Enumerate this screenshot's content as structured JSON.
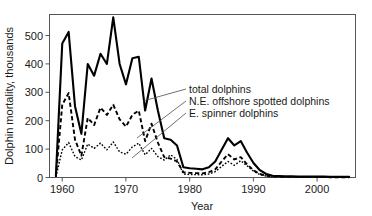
{
  "chart_data": {
    "type": "line",
    "title": "",
    "xlabel": "Year",
    "ylabel": "Dolphin mortality, thousands",
    "xlim": [
      1958,
      2006
    ],
    "ylim": [
      0,
      560
    ],
    "grid": false,
    "legend_position": "inline-annotations",
    "xticks": [
      "1960",
      "1970",
      "1980",
      "1990",
      "2000"
    ],
    "xtick_values": [
      1960,
      1970,
      1980,
      1990,
      2000
    ],
    "yticks": [
      "0",
      "100",
      "200",
      "300",
      "400",
      "500"
    ],
    "ytick_values": [
      0,
      100,
      200,
      300,
      400,
      500
    ],
    "x": [
      1959,
      1960,
      1961,
      1962,
      1963,
      1964,
      1965,
      1966,
      1967,
      1968,
      1969,
      1970,
      1971,
      1972,
      1973,
      1974,
      1975,
      1976,
      1977,
      1978,
      1979,
      1980,
      1981,
      1982,
      1983,
      1984,
      1985,
      1986,
      1987,
      1988,
      1989,
      1990,
      1991,
      1992,
      1993,
      1994,
      1995,
      1996,
      1997,
      1998,
      1999,
      2000,
      2001,
      2002,
      2003,
      2004,
      2005
    ],
    "series": [
      {
        "name": "total dolphins",
        "style": "solid",
        "values": [
          5,
          460,
          500,
          245,
          150,
          390,
          350,
          425,
          390,
          550,
          390,
          320,
          410,
          415,
          230,
          340,
          230,
          135,
          130,
          110,
          35,
          32,
          30,
          28,
          35,
          55,
          95,
          135,
          110,
          125,
          85,
          50,
          25,
          12,
          6,
          5,
          4,
          4,
          3,
          3,
          3,
          3,
          3,
          2,
          2,
          2,
          2
        ]
      },
      {
        "name": "N.E. offshore spotted dolphins",
        "style": "dashed",
        "values": [
          3,
          250,
          290,
          130,
          75,
          205,
          180,
          240,
          215,
          250,
          200,
          175,
          215,
          230,
          125,
          185,
          120,
          70,
          65,
          55,
          18,
          16,
          15,
          14,
          18,
          28,
          55,
          80,
          62,
          70,
          45,
          25,
          12,
          6,
          3,
          2,
          2,
          2,
          2,
          2,
          2,
          2,
          2,
          1,
          1,
          1,
          1
        ]
      },
      {
        "name": "E. spinner dolphins",
        "style": "dotted",
        "values": [
          2,
          95,
          120,
          72,
          60,
          115,
          100,
          118,
          95,
          122,
          88,
          80,
          105,
          118,
          78,
          100,
          72,
          60,
          78,
          62,
          12,
          10,
          10,
          9,
          12,
          20,
          38,
          55,
          42,
          58,
          40,
          22,
          10,
          5,
          2,
          2,
          2,
          2,
          2,
          2,
          2,
          2,
          2,
          1,
          1,
          1,
          1
        ]
      }
    ],
    "annotations": [
      {
        "text": "total dolphins",
        "series": "total dolphins"
      },
      {
        "text": "N.E. offshore spotted dolphins",
        "series": "N.E. offshore spotted dolphins"
      },
      {
        "text": "E. spinner dolphins",
        "series": "E. spinner dolphins"
      }
    ]
  }
}
